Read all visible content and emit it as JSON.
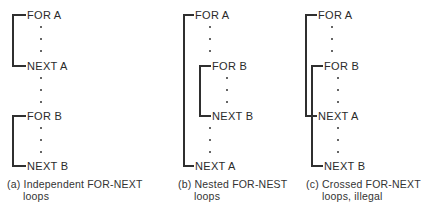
{
  "panels": [
    {
      "id": "a",
      "statements": [
        "FOR A",
        "NEXT A",
        "FOR B",
        "NEXT B"
      ],
      "caption_line1": "(a) Independent FOR-NEXT",
      "caption_line2": "loops"
    },
    {
      "id": "b",
      "statements": [
        "FOR A",
        "FOR B",
        "NEXT B",
        "NEXT A"
      ],
      "caption_line1": "(b) Nested FOR-NEST",
      "caption_line2": "loops"
    },
    {
      "id": "c",
      "statements": [
        "FOR A",
        "FOR B",
        "NEXT A",
        "NEXT B"
      ],
      "caption_line1": "(c) Crossed FOR-NEXT",
      "caption_line2": "loops, illegal"
    }
  ],
  "dot_glyph": "·",
  "line_color": "#2f2f2f"
}
